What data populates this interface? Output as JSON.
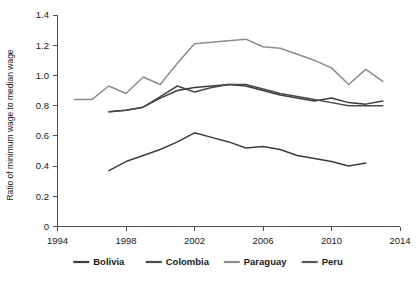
{
  "chart_data": {
    "type": "line",
    "title": "",
    "xlabel": "",
    "ylabel": "Ratio of minimum wage to median wage",
    "xlim": [
      1994,
      2014
    ],
    "ylim": [
      0,
      1.4
    ],
    "grid": false,
    "legend_position": "bottom",
    "xticks": [
      "1994",
      "1998",
      "2002",
      "2006",
      "2010",
      "2014"
    ],
    "xtick_values": [
      1994,
      1998,
      2002,
      2006,
      2010,
      2014
    ],
    "yticks": [
      "0",
      "0.2",
      "0.4",
      "0.6",
      "0.8",
      "1.0",
      "1.2",
      "1.4"
    ],
    "ytick_values": [
      0,
      0.2,
      0.4,
      0.6,
      0.8,
      1.0,
      1.2,
      1.4
    ],
    "series": [
      {
        "name": "Bolivia",
        "color": "#3d3d3d",
        "x": [
          1997,
          1998,
          1999,
          2000,
          2001,
          2002,
          2003,
          2004,
          2005,
          2006,
          2007,
          2008,
          2009,
          2010,
          2011,
          2012,
          2013
        ],
        "values": [
          0.76,
          0.77,
          0.79,
          0.85,
          0.9,
          0.92,
          0.93,
          0.94,
          0.93,
          0.9,
          0.87,
          0.85,
          0.83,
          0.85,
          0.82,
          0.81,
          0.83
        ]
      },
      {
        "name": "Colombia",
        "color": "#4a4a4a",
        "x": [
          1997,
          1998,
          1999,
          2000,
          2001,
          2002,
          2003,
          2004,
          2005,
          2006,
          2007,
          2008,
          2009,
          2010,
          2011,
          2012,
          2013
        ],
        "values": [
          0.76,
          0.77,
          0.79,
          0.86,
          0.93,
          0.89,
          0.92,
          0.94,
          0.94,
          0.91,
          0.88,
          0.86,
          0.84,
          0.82,
          0.8,
          0.8,
          0.8
        ]
      },
      {
        "name": "Paraguay",
        "color": "#8c8c8c",
        "x": [
          1995,
          1996,
          1997,
          1998,
          1999,
          2000,
          2001,
          2002,
          2003,
          2004,
          2005,
          2006,
          2007,
          2008,
          2009,
          2010,
          2011,
          2012,
          2013
        ],
        "values": [
          0.84,
          0.84,
          0.93,
          0.88,
          0.99,
          0.94,
          1.08,
          1.21,
          1.22,
          1.23,
          1.24,
          1.19,
          1.18,
          1.14,
          1.1,
          1.05,
          0.94,
          1.04,
          0.96
        ]
      },
      {
        "name": "Peru",
        "color": "#3d3d3d",
        "x": [
          1997,
          1998,
          1999,
          2000,
          2001,
          2002,
          2003,
          2004,
          2005,
          2006,
          2007,
          2008,
          2009,
          2010,
          2011,
          2012
        ],
        "values": [
          0.37,
          0.43,
          0.47,
          0.51,
          0.56,
          0.62,
          0.59,
          0.56,
          0.52,
          0.53,
          0.51,
          0.47,
          0.45,
          0.43,
          0.4,
          0.42
        ]
      }
    ],
    "legend": [
      {
        "label": "Bolivia",
        "color": "#3d3d3d"
      },
      {
        "label": "Colombia",
        "color": "#4a4a4a"
      },
      {
        "label": "Paraguay",
        "color": "#8c8c8c"
      },
      {
        "label": "Peru",
        "color": "#5a5a5a"
      }
    ]
  }
}
